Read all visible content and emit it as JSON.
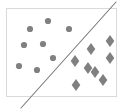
{
  "figure": {
    "title": "",
    "background_color": "#ffffff",
    "width": 127,
    "height": 112
  },
  "plot_frame": {
    "name": "plot-border-rectangle",
    "x": 6,
    "y": 8,
    "width": 111,
    "height": 89,
    "stroke_color": "#d9d9d9",
    "stroke_width": 1,
    "fill_color": "#ffffff"
  },
  "decision_boundary": {
    "name": "decision-boundary-line",
    "x1": 21,
    "y1": 108,
    "x2": 116,
    "y2": 2,
    "stroke_color": "#7a7a7a",
    "stroke_width": 1.1,
    "label": ""
  },
  "chart_data": {
    "type": "scatter",
    "title": "",
    "xlabel": "",
    "ylabel": "",
    "xlim": [
      6,
      117
    ],
    "ylim": [
      8,
      97
    ],
    "grid": false,
    "legend": "none",
    "axes_visible": false,
    "tick_labels_x": [],
    "tick_labels_y": [],
    "marker_color": "#808080",
    "series": [
      {
        "name": "class-a",
        "marker": "circle",
        "color": "#808080",
        "marker_size": 5,
        "count": 8,
        "points": [
          {
            "x": 48,
            "y": 21
          },
          {
            "x": 30,
            "y": 29
          },
          {
            "x": 69,
            "y": 29
          },
          {
            "x": 24,
            "y": 45
          },
          {
            "x": 43,
            "y": 44
          },
          {
            "x": 19,
            "y": 66
          },
          {
            "x": 37,
            "y": 70
          },
          {
            "x": 53,
            "y": 58
          }
        ]
      },
      {
        "name": "class-b",
        "marker": "diamond",
        "color": "#808080",
        "marker_size": 6,
        "count": 8,
        "points": [
          {
            "x": 110,
            "y": 41
          },
          {
            "x": 91,
            "y": 49
          },
          {
            "x": 110,
            "y": 58
          },
          {
            "x": 75,
            "y": 61
          },
          {
            "x": 95,
            "y": 72
          },
          {
            "x": 103,
            "y": 80
          },
          {
            "x": 76,
            "y": 85
          },
          {
            "x": 88,
            "y": 68
          }
        ]
      }
    ]
  }
}
